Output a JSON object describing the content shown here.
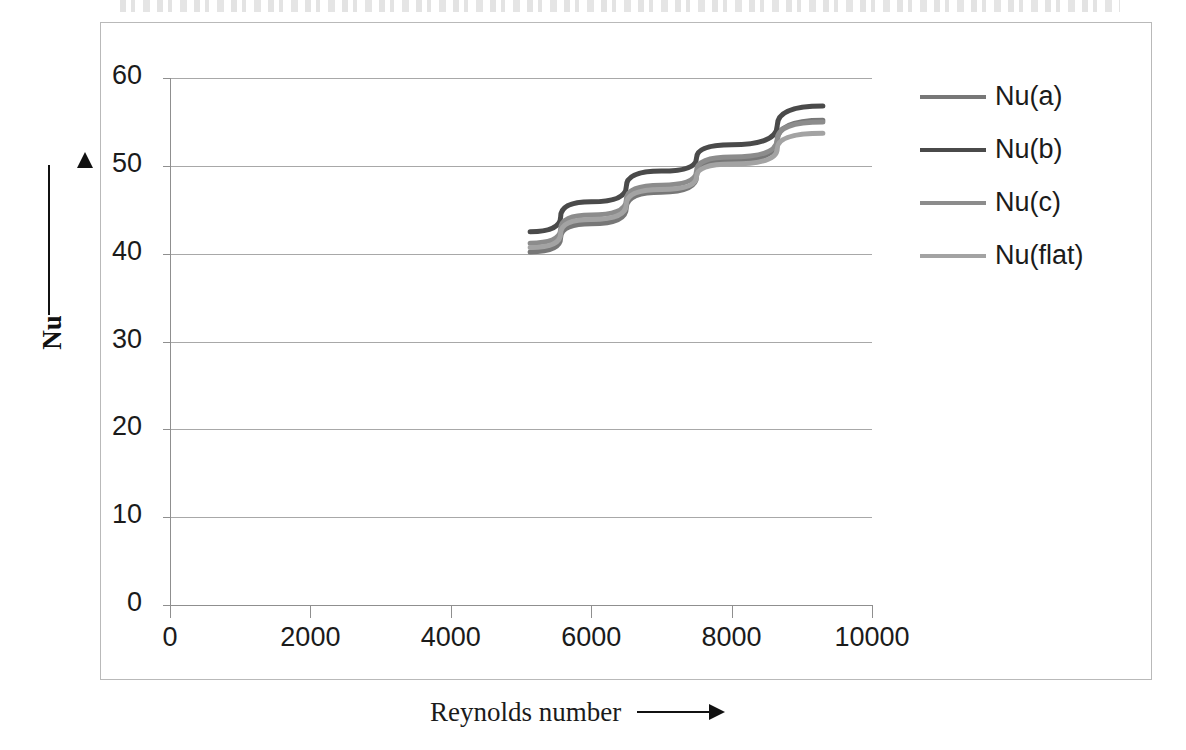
{
  "chart_data": {
    "type": "line",
    "title": "",
    "xlabel": "Reynolds number",
    "ylabel": "Nu",
    "xlim": [
      0,
      10000
    ],
    "ylim": [
      0,
      60
    ],
    "xticks": [
      0,
      2000,
      4000,
      6000,
      8000,
      10000
    ],
    "yticks": [
      0,
      10,
      20,
      30,
      40,
      50,
      60
    ],
    "xtick_labels": [
      "0",
      "2000",
      "4000",
      "6000",
      "8000",
      "10000"
    ],
    "ytick_labels": [
      "0",
      "10",
      "20",
      "30",
      "40",
      "50",
      "60"
    ],
    "grid": "horizontal",
    "legend_position": "right",
    "x": [
      5130,
      6000,
      7000,
      8000,
      9300
    ],
    "series": [
      {
        "name": "Nu(a)",
        "color": "#777777",
        "values": [
          40.2,
          43.4,
          47.0,
          50.6,
          55.2
        ]
      },
      {
        "name": "Nu(b)",
        "color": "#4a4a4a",
        "values": [
          42.5,
          45.9,
          49.4,
          52.4,
          56.8
        ]
      },
      {
        "name": "Nu(c)",
        "color": "#8c8c8c",
        "values": [
          41.2,
          44.4,
          47.8,
          51.0,
          55.0
        ]
      },
      {
        "name": "Nu(flat)",
        "color": "#a3a3a3",
        "values": [
          40.7,
          43.9,
          47.3,
          50.2,
          53.7
        ]
      }
    ]
  },
  "axes": {
    "y_arrow": "up-arrow",
    "x_arrow": "right-arrow"
  },
  "legend": {
    "items": [
      {
        "label": "Nu(a)"
      },
      {
        "label": "Nu(b)"
      },
      {
        "label": "Nu(c)"
      },
      {
        "label": "Nu(flat)"
      }
    ]
  },
  "colors": {
    "gridline": "#a8a8a8",
    "axis": "#8f8f8f",
    "border": "#b9b9b9",
    "text": "#1b1b1b"
  }
}
